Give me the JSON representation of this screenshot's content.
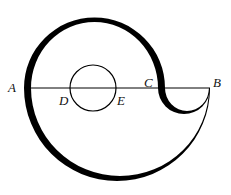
{
  "diagram": {
    "type": "geometry-figure",
    "segment": {
      "from": "A",
      "to": "B",
      "passes_through": [
        "D",
        "E",
        "C"
      ]
    },
    "labels": {
      "A": "A",
      "B": "B",
      "C": "C",
      "D": "D",
      "E": "E"
    },
    "shapes": [
      {
        "name": "upper-semicircle",
        "diameter": "AC",
        "side": "above",
        "stroke": "thick"
      },
      {
        "name": "lower-semicircle",
        "diameter": "AB",
        "side": "below",
        "stroke": "tapered"
      },
      {
        "name": "small-semicircle",
        "diameter": "CB",
        "side": "below",
        "stroke": "tapered"
      },
      {
        "name": "small-circle",
        "diameter": "DE",
        "stroke": "thin"
      }
    ],
    "colors": {
      "stroke": "#000000",
      "background": "#ffffff"
    }
  }
}
